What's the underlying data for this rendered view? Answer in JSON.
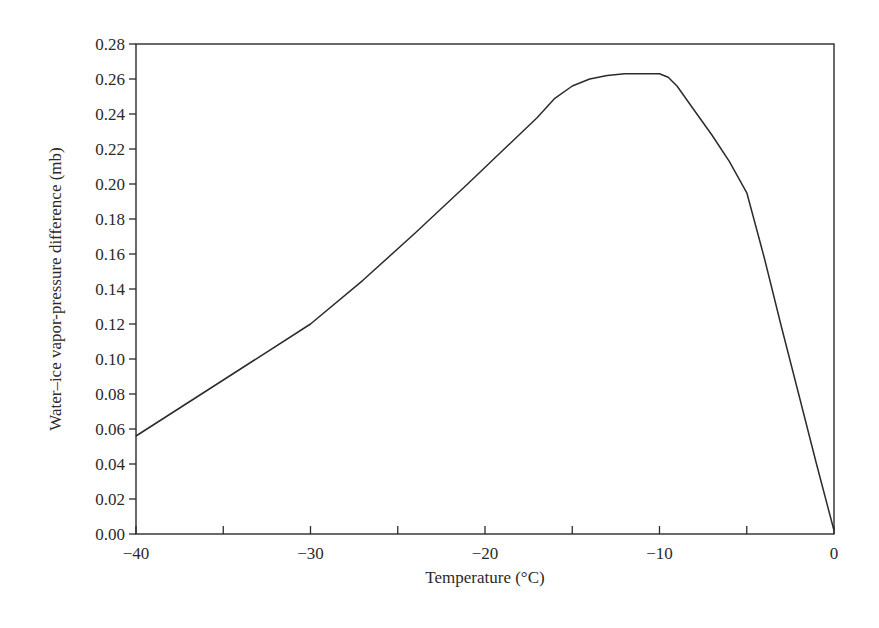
{
  "chart_data": {
    "type": "line",
    "title": "",
    "xlabel": "Temperature (°C)",
    "ylabel": "Water–ice vapor-pressure difference (mb)",
    "xlim": [
      -40,
      0
    ],
    "ylim": [
      0,
      0.28
    ],
    "grid": false,
    "legend": null,
    "x_ticks": [
      -40,
      -35,
      -30,
      -25,
      -20,
      -15,
      -10,
      -5,
      0
    ],
    "x_tick_labels": [
      "−40",
      "",
      "−30",
      "",
      "−20",
      "",
      "−10",
      "",
      "0"
    ],
    "y_ticks": [
      0.0,
      0.02,
      0.04,
      0.06,
      0.08,
      0.1,
      0.12,
      0.14,
      0.16,
      0.18,
      0.2,
      0.22,
      0.24,
      0.26,
      0.28
    ],
    "y_tick_labels": [
      "0.00",
      "0.02",
      "0.04",
      "0.06",
      "0.08",
      "0.10",
      "0.12",
      "0.14",
      "0.16",
      "0.18",
      "0.20",
      "0.22",
      "0.24",
      "0.26",
      "0.28"
    ],
    "series": [
      {
        "name": "Water-ice vapor-pressure difference",
        "x": [
          -40,
          -35,
          -30,
          -27,
          -24,
          -21,
          -19,
          -17,
          -16,
          -15,
          -14,
          -13,
          -12,
          -11,
          -10,
          -9.5,
          -9,
          -8,
          -7,
          -6,
          -5,
          -4,
          -3,
          -2,
          -1,
          0
        ],
        "y": [
          0.056,
          0.088,
          0.12,
          0.145,
          0.172,
          0.2,
          0.219,
          0.238,
          0.249,
          0.256,
          0.26,
          0.262,
          0.263,
          0.263,
          0.263,
          0.261,
          0.256,
          0.242,
          0.228,
          0.213,
          0.195,
          0.158,
          0.118,
          0.079,
          0.04,
          0.002
        ]
      }
    ]
  },
  "colors": {
    "line": "#2b2b2b",
    "axis": "#2b2b2b",
    "background": "#ffffff"
  }
}
